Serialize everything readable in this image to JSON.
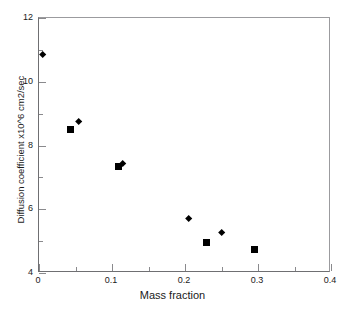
{
  "chart_data": {
    "type": "scatter",
    "title": "",
    "xlabel": "Mass fraction",
    "ylabel": "Diffusion coefficient x10^6 cm2/sec",
    "xlim": [
      0,
      0.4
    ],
    "ylim": [
      4,
      12
    ],
    "grid": false,
    "legend": "none",
    "x_ticks": [
      {
        "value": 0,
        "label": "0",
        "major": true
      },
      {
        "value": 0.05,
        "label": "",
        "major": false
      },
      {
        "value": 0.1,
        "label": "0.1",
        "major": true
      },
      {
        "value": 0.15,
        "label": "",
        "major": false
      },
      {
        "value": 0.2,
        "label": "0.2",
        "major": true
      },
      {
        "value": 0.25,
        "label": "",
        "major": false
      },
      {
        "value": 0.3,
        "label": "0.3",
        "major": true
      },
      {
        "value": 0.35,
        "label": "",
        "major": false
      },
      {
        "value": 0.4,
        "label": "0.4",
        "major": true
      }
    ],
    "y_ticks": [
      {
        "value": 4,
        "label": "4",
        "major": true
      },
      {
        "value": 5,
        "label": "",
        "major": false
      },
      {
        "value": 6,
        "label": "6",
        "major": true
      },
      {
        "value": 7,
        "label": "",
        "major": false
      },
      {
        "value": 8,
        "label": "8",
        "major": true
      },
      {
        "value": 9,
        "label": "",
        "major": false
      },
      {
        "value": 10,
        "label": "10",
        "major": true
      },
      {
        "value": 11,
        "label": "",
        "major": false
      },
      {
        "value": 12,
        "label": "12",
        "major": true
      }
    ],
    "points": [
      {
        "x": 0.005,
        "y": 10.85,
        "marker": "diamond"
      },
      {
        "x": 0.043,
        "y": 8.5,
        "marker": "square"
      },
      {
        "x": 0.055,
        "y": 8.75,
        "marker": "diamond"
      },
      {
        "x": 0.109,
        "y": 7.35,
        "marker": "square"
      },
      {
        "x": 0.114,
        "y": 7.42,
        "marker": "diamond"
      },
      {
        "x": 0.205,
        "y": 5.7,
        "marker": "diamond"
      },
      {
        "x": 0.23,
        "y": 4.95,
        "marker": "square"
      },
      {
        "x": 0.25,
        "y": 5.25,
        "marker": "diamond"
      },
      {
        "x": 0.295,
        "y": 4.75,
        "marker": "square"
      }
    ],
    "marker_color": "#000000",
    "axis_color": "#6f6f72"
  }
}
